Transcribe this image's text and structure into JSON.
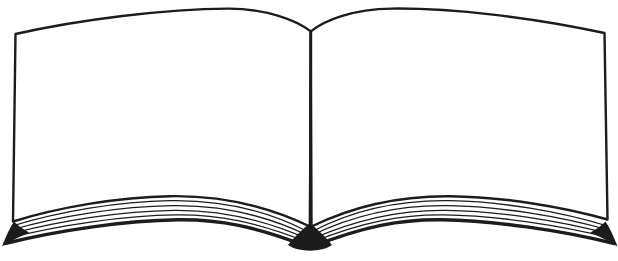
{
  "figure": {
    "style": "black-and-white line art",
    "left_page": "blank left page",
    "right_page": "blank right page",
    "spine": "center spine crease",
    "page_edge_lines_per_side": 4,
    "ink_accents": [
      "spine-base wedge",
      "left-corner wedge",
      "right-corner wedge"
    ]
  },
  "colors": {
    "ink": "#1c1c1c",
    "paper": "#ffffff",
    "background": "#ffffff"
  }
}
